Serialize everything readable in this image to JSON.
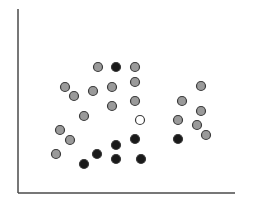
{
  "chart_data": {
    "type": "scatter",
    "title": "",
    "xlabel": "",
    "ylabel": "",
    "grid": false,
    "legend": null,
    "ticks": false,
    "axes": {
      "color": "#4a4a4a",
      "origin_px": [
        18,
        193
      ],
      "x_end_px": 235,
      "y_end_px": 9
    },
    "marker": {
      "radius": 4.5,
      "stroke": "#3a3a3a",
      "stroke_width": 1.2
    },
    "series": [
      {
        "name": "gray",
        "fill": "#9a9a9a",
        "points": [
          [
            98,
            67
          ],
          [
            135,
            67
          ],
          [
            135,
            82
          ],
          [
            65,
            87
          ],
          [
            93,
            91
          ],
          [
            112,
            87
          ],
          [
            74,
            96
          ],
          [
            135,
            101
          ],
          [
            112,
            106
          ],
          [
            84,
            116
          ],
          [
            60,
            130
          ],
          [
            70,
            140
          ],
          [
            56,
            154
          ],
          [
            201,
            86
          ],
          [
            182,
            101
          ],
          [
            201,
            111
          ],
          [
            178,
            120
          ],
          [
            197,
            125
          ],
          [
            206,
            135
          ]
        ]
      },
      {
        "name": "black",
        "fill": "#1a1a1a",
        "points": [
          [
            116,
            67
          ],
          [
            135,
            139
          ],
          [
            116,
            145
          ],
          [
            97,
            154
          ],
          [
            84,
            164
          ],
          [
            116,
            159
          ],
          [
            141,
            159
          ],
          [
            178,
            139
          ]
        ]
      },
      {
        "name": "white",
        "fill": "#ffffff",
        "points": [
          [
            140,
            120
          ]
        ]
      }
    ]
  }
}
